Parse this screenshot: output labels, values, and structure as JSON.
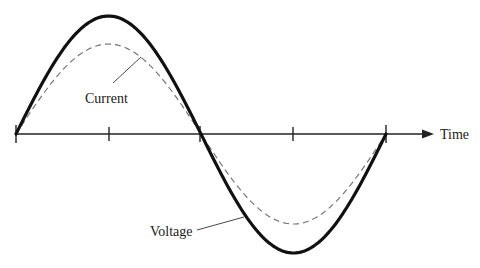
{
  "diagram": {
    "type": "ac-waveform",
    "axis": {
      "label": "Time",
      "tick_count": 5
    },
    "curves": [
      {
        "name": "Voltage",
        "style": "solid",
        "color": "#111111",
        "stroke_width": 3.2,
        "peak_y": 16,
        "trough_y": 253
      },
      {
        "name": "Current",
        "style": "dashed",
        "color": "#777777",
        "stroke_width": 1.2,
        "peak_y": 44,
        "trough_y": 224
      }
    ],
    "labels": {
      "current": "Current",
      "voltage": "Voltage",
      "time": "Time"
    }
  }
}
